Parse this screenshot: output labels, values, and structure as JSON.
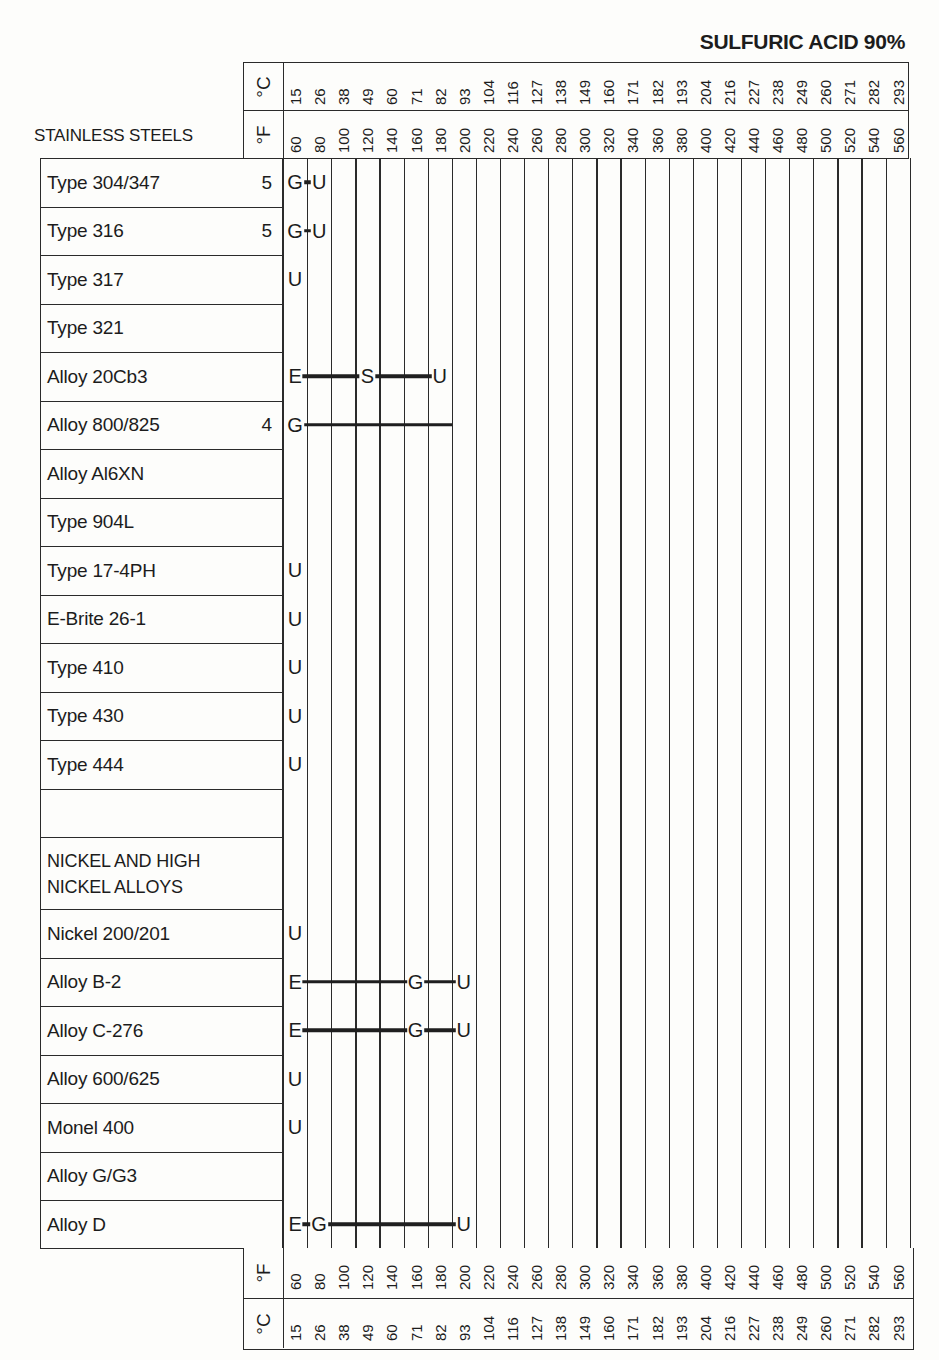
{
  "title": "SULFURIC ACID 90%",
  "section_heads": {
    "stainless": "STAINLESS STEELS",
    "nickel": "NICKEL AND HIGH NICKEL ALLOYS",
    "nickel_line1": "NICKEL AND HIGH",
    "nickel_line2": "NICKEL ALLOYS"
  },
  "units": {
    "celsius": "°C",
    "fahrenheit": "°F"
  },
  "axis": {
    "fahrenheit": [
      "60",
      "80",
      "100",
      "120",
      "140",
      "160",
      "180",
      "200",
      "220",
      "240",
      "260",
      "280",
      "300",
      "320",
      "340",
      "360",
      "380",
      "400",
      "420",
      "440",
      "460",
      "480",
      "500",
      "520",
      "540",
      "560"
    ],
    "celsius": [
      "15",
      "26",
      "38",
      "49",
      "60",
      "71",
      "82",
      "93",
      "104",
      "116",
      "127",
      "138",
      "149",
      "160",
      "171",
      "182",
      "193",
      "204",
      "216",
      "227",
      "238",
      "249",
      "260",
      "271",
      "282",
      "293"
    ]
  },
  "rows": [
    {
      "name": "Type 304/347",
      "note": "5"
    },
    {
      "name": "Type 316",
      "note": "5"
    },
    {
      "name": "Type 317",
      "note": ""
    },
    {
      "name": "Type 321",
      "note": ""
    },
    {
      "name": "Alloy 20Cb3",
      "note": ""
    },
    {
      "name": "Alloy 800/825",
      "note": "4"
    },
    {
      "name": "Alloy Al6XN",
      "note": ""
    },
    {
      "name": "Type 904L",
      "note": ""
    },
    {
      "name": "Type 17-4PH",
      "note": ""
    },
    {
      "name": "E-Brite 26-1",
      "note": ""
    },
    {
      "name": "Type 410",
      "note": ""
    },
    {
      "name": "Type 430",
      "note": ""
    },
    {
      "name": "Type 444",
      "note": ""
    },
    {
      "name": "",
      "note": ""
    },
    {
      "name": "NICKEL AND HIGH NICKEL ALLOYS",
      "note": ""
    },
    {
      "name": "Nickel 200/201",
      "note": ""
    },
    {
      "name": "Alloy B-2",
      "note": ""
    },
    {
      "name": "Alloy C-276",
      "note": ""
    },
    {
      "name": "Alloy 600/625",
      "note": ""
    },
    {
      "name": "Monel 400",
      "note": ""
    },
    {
      "name": "Alloy G/G3",
      "note": ""
    },
    {
      "name": "Alloy D",
      "note": ""
    }
  ],
  "chart_data": {
    "type": "table",
    "title": "SULFURIC ACID 90%",
    "xlabel": "Temperature (°F / °C)",
    "x_fahrenheit": [
      60,
      80,
      100,
      120,
      140,
      160,
      180,
      200,
      220,
      240,
      260,
      280,
      300,
      320,
      340,
      360,
      380,
      400,
      420,
      440,
      460,
      480,
      500,
      520,
      540,
      560
    ],
    "x_celsius": [
      15,
      26,
      38,
      49,
      60,
      71,
      82,
      93,
      104,
      116,
      127,
      138,
      149,
      160,
      171,
      182,
      193,
      204,
      216,
      227,
      238,
      249,
      260,
      271,
      282,
      293
    ],
    "groups": [
      "STAINLESS STEELS",
      "NICKEL AND HIGH NICKEL ALLOYS"
    ],
    "legend_letters": [
      "E",
      "G",
      "S",
      "U"
    ],
    "series": [
      {
        "name": "Type 304/347",
        "group": "STAINLESS STEELS",
        "note": "5",
        "ratings": [
          {
            "F": 60,
            "r": "G"
          },
          {
            "F": 80,
            "r": "U"
          }
        ]
      },
      {
        "name": "Type 316",
        "group": "STAINLESS STEELS",
        "note": "5",
        "ratings": [
          {
            "F": 60,
            "r": "G"
          },
          {
            "F": 80,
            "r": "U"
          }
        ]
      },
      {
        "name": "Type 317",
        "group": "STAINLESS STEELS",
        "ratings": [
          {
            "F": 60,
            "r": "U"
          }
        ]
      },
      {
        "name": "Type 321",
        "group": "STAINLESS STEELS",
        "ratings": []
      },
      {
        "name": "Alloy 20Cb3",
        "group": "STAINLESS STEELS",
        "ratings": [
          {
            "F": 60,
            "r": "E"
          },
          {
            "F": 120,
            "r": "S"
          },
          {
            "F": 180,
            "r": "U"
          }
        ]
      },
      {
        "name": "Alloy 800/825",
        "group": "STAINLESS STEELS",
        "note": "4",
        "ratings": [
          {
            "F": 60,
            "r": "G",
            "to_F": 190
          }
        ]
      },
      {
        "name": "Alloy Al6XN",
        "group": "STAINLESS STEELS",
        "ratings": []
      },
      {
        "name": "Type 904L",
        "group": "STAINLESS STEELS",
        "ratings": []
      },
      {
        "name": "Type 17-4PH",
        "group": "STAINLESS STEELS",
        "ratings": [
          {
            "F": 60,
            "r": "U"
          }
        ]
      },
      {
        "name": "E-Brite 26-1",
        "group": "STAINLESS STEELS",
        "ratings": [
          {
            "F": 60,
            "r": "U"
          }
        ]
      },
      {
        "name": "Type 410",
        "group": "STAINLESS STEELS",
        "ratings": [
          {
            "F": 60,
            "r": "U"
          }
        ]
      },
      {
        "name": "Type 430",
        "group": "STAINLESS STEELS",
        "ratings": [
          {
            "F": 60,
            "r": "U"
          }
        ]
      },
      {
        "name": "Type 444",
        "group": "STAINLESS STEELS",
        "ratings": [
          {
            "F": 60,
            "r": "U"
          }
        ]
      },
      {
        "name": "Nickel 200/201",
        "group": "NICKEL AND HIGH NICKEL ALLOYS",
        "ratings": [
          {
            "F": 60,
            "r": "U"
          }
        ]
      },
      {
        "name": "Alloy B-2",
        "group": "NICKEL AND HIGH NICKEL ALLOYS",
        "ratings": [
          {
            "F": 60,
            "r": "E"
          },
          {
            "F": 160,
            "r": "G"
          },
          {
            "F": 200,
            "r": "U"
          }
        ]
      },
      {
        "name": "Alloy C-276",
        "group": "NICKEL AND HIGH NICKEL ALLOYS",
        "ratings": [
          {
            "F": 60,
            "r": "E"
          },
          {
            "F": 160,
            "r": "G"
          },
          {
            "F": 200,
            "r": "U"
          }
        ]
      },
      {
        "name": "Alloy 600/625",
        "group": "NICKEL AND HIGH NICKEL ALLOYS",
        "ratings": [
          {
            "F": 60,
            "r": "U"
          }
        ]
      },
      {
        "name": "Monel 400",
        "group": "NICKEL AND HIGH NICKEL ALLOYS",
        "ratings": [
          {
            "F": 60,
            "r": "U"
          }
        ]
      },
      {
        "name": "Alloy G/G3",
        "group": "NICKEL AND HIGH NICKEL ALLOYS",
        "ratings": []
      },
      {
        "name": "Alloy D",
        "group": "NICKEL AND HIGH NICKEL ALLOYS",
        "ratings": [
          {
            "F": 60,
            "r": "E"
          },
          {
            "F": 80,
            "r": "G"
          },
          {
            "F": 200,
            "r": "U"
          }
        ]
      }
    ],
    "grid": true
  }
}
